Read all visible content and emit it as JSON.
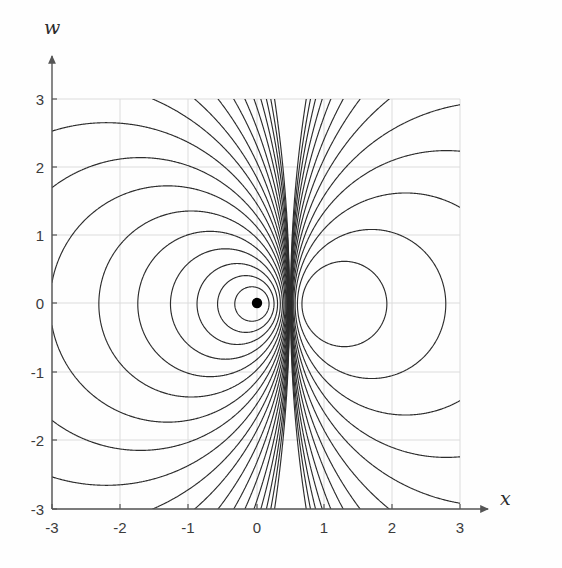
{
  "figure": {
    "background": "#fefefe",
    "axis_color": "#555555",
    "grid_color": "#d9d9d9",
    "contour_color": "#2a2a2a",
    "marker_color": "#000000"
  },
  "axes": {
    "x_label": "x",
    "w_label": "w",
    "x_ticks": [
      "-3",
      "-2",
      "-1",
      "0",
      "1",
      "2",
      "3"
    ],
    "w_ticks": [
      "3",
      "2",
      "1",
      "0",
      "-1",
      "-2",
      "-3"
    ]
  },
  "chart_data": {
    "type": "line",
    "title": "",
    "xlabel": "x",
    "ylabel": "w",
    "xlim": [
      -3,
      3
    ],
    "ylim": [
      -3,
      3
    ],
    "x": [
      -3,
      -2,
      -1,
      0,
      1,
      2,
      3
    ],
    "categories": [
      "-3",
      "-2",
      "-1",
      "0",
      "1",
      "2",
      "3"
    ],
    "values": [
      -3,
      -2,
      -1,
      0,
      1,
      2,
      3
    ],
    "grid": true,
    "legend": "none",
    "plot_kind": "contour",
    "xticks": [
      -3,
      -2,
      -1,
      0,
      1,
      2,
      3
    ],
    "yticks": [
      -3,
      -2,
      -1,
      0,
      1,
      2,
      3
    ],
    "asymptote_x": 0.5,
    "center_point": [
      0,
      0
    ],
    "annotations": [
      {
        "label": "center marker",
        "x": 0,
        "y": 0
      },
      {
        "label": "vertical asymptote",
        "x": 0.5
      }
    ],
    "contour_levels": [
      0.12,
      0.3,
      0.55,
      0.9,
      1.35,
      1.9,
      2.6,
      3.4,
      4.4,
      5.6,
      7.0,
      8.8,
      11.0,
      13.6,
      17.0,
      21.0,
      26.0,
      32.0,
      40.0
    ],
    "series": [
      {
        "name": "contours-left-lobe",
        "description": "closed loops around center (0,0)"
      },
      {
        "name": "contours-right-branch",
        "description": "open curves right of asymptote x=0.5"
      }
    ]
  }
}
